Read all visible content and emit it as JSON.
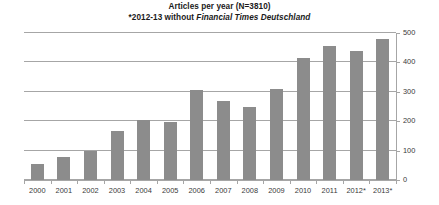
{
  "chart_data": {
    "type": "bar",
    "title": "Articles per year (N=3810)",
    "subtitle_prefix": "*2012-13 without ",
    "subtitle_italic": "Financial Times Deutschland",
    "xlabel": "",
    "ylabel": "",
    "ylim": [
      0,
      500
    ],
    "yticks": [
      0,
      100,
      200,
      300,
      400,
      500
    ],
    "ytick_labels": [
      "0",
      "100",
      "200",
      "300",
      "400",
      "500"
    ],
    "grid": true,
    "y_axis_position": "right",
    "legend": "none",
    "categories": [
      "2000",
      "2001",
      "2002",
      "2003",
      "2004",
      "2005",
      "2006",
      "2007",
      "2008",
      "2009",
      "2010",
      "2011",
      "2012*",
      "2013*"
    ],
    "values": [
      55,
      78,
      100,
      168,
      205,
      198,
      305,
      270,
      248,
      310,
      415,
      455,
      440,
      480
    ],
    "bar_color": "#8c8c8c",
    "axis_color": "#a6a6a6",
    "text_color": "#3a3a3a"
  }
}
